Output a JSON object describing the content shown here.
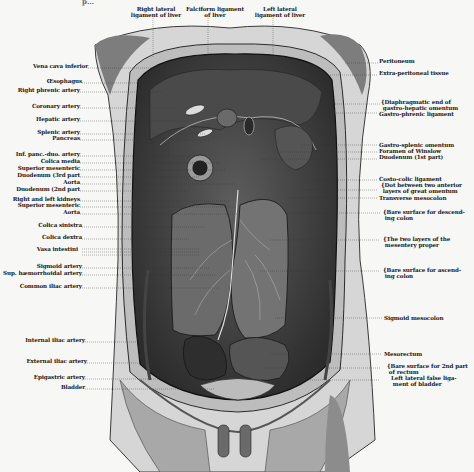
{
  "figure": {
    "caption_partial": "p…",
    "top_labels": [
      {
        "id": "right-lateral-ligament",
        "text": "Right lateral\nligament of liver",
        "x": 155,
        "y": 7
      },
      {
        "id": "falciform-ligament",
        "text": "Falciform ligament\nof liver",
        "x": 217,
        "y": 7
      },
      {
        "id": "left-lateral-ligament",
        "text": "Left lateral\nligament of liver",
        "x": 282,
        "y": 7
      }
    ],
    "left_labels": [
      {
        "text": "Vena cava inferior",
        "y": 66
      },
      {
        "text": "Œsophagus",
        "y": 81
      },
      {
        "text": "Right phrenic artery",
        "y": 90
      },
      {
        "text": "Coronary artery",
        "y": 106
      },
      {
        "text": "Hepatic artery",
        "y": 119
      },
      {
        "text": "Splenic artery",
        "y": 132
      },
      {
        "text": "Pancreas",
        "y": 138
      },
      {
        "text": "Inf. panc.-duo. artery",
        "y": 154
      },
      {
        "text": "Colica media",
        "y": 161
      },
      {
        "text": "Superior mesenteric",
        "y": 168
      },
      {
        "text": "Duodenum (3rd part",
        "y": 175
      },
      {
        "text": "Aorta",
        "y": 182
      },
      {
        "text": "Duodenum (2nd part",
        "y": 189
      },
      {
        "text": "Right and left kidneys",
        "y": 199
      },
      {
        "text": "Superior mesenteric",
        "y": 205
      },
      {
        "text": "Aorta",
        "y": 212
      },
      {
        "text": "Colica sinistra",
        "y": 225
      },
      {
        "text": "Colica dextra",
        "y": 237
      },
      {
        "text": "Vasa intestini",
        "y": 249
      },
      {
        "text": "Sigmoid artery",
        "y": 266
      },
      {
        "text": "Sup. hæmorrhoidal artery",
        "y": 273
      },
      {
        "text": "Common iliac artery",
        "y": 286
      },
      {
        "text": "Internal iliac artery",
        "y": 340
      },
      {
        "text": "External iliac artery",
        "y": 361
      },
      {
        "text": "Epigastric artery",
        "y": 377
      },
      {
        "text": "Bladder",
        "y": 387
      }
    ],
    "right_labels": [
      {
        "text": "Peritoneum",
        "y": 61
      },
      {
        "text": "Extra-peritoneal tissue",
        "y": 73
      },
      {
        "text": "{Diaphragmatic end of\n gastro-hepatic omentum",
        "y": 100
      },
      {
        "text": "Gastro-phrenic ligament",
        "y": 111
      },
      {
        "text": "Gastro-splenic omentum",
        "y": 143
      },
      {
        "text": "Foramen of Winslow",
        "y": 150
      },
      {
        "text": "Duodenum (1st part)",
        "y": 157
      },
      {
        "text": "Costo-colic ligament",
        "y": 178
      },
      {
        "text": "{Dot between two anterior\n layers of great omentum",
        "y": 184
      },
      {
        "text": "Transverse mesocolon",
        "y": 196
      },
      {
        "text": "{Bare surface for descend-\n ing colon",
        "y": 210
      },
      {
        "text": "{The two layers of the\n mesentery proper",
        "y": 237
      },
      {
        "text": "{Bare surface for ascend-\n ing colon",
        "y": 268
      },
      {
        "text": "Sigmoid mesocolon",
        "y": 316
      },
      {
        "text": "Mesorectum",
        "y": 352
      },
      {
        "text": "{Bare surface for 2nd part\n of rectum",
        "y": 365
      },
      {
        "text": "Left lateral false liga-\n ment of bladder",
        "y": 376
      }
    ]
  }
}
